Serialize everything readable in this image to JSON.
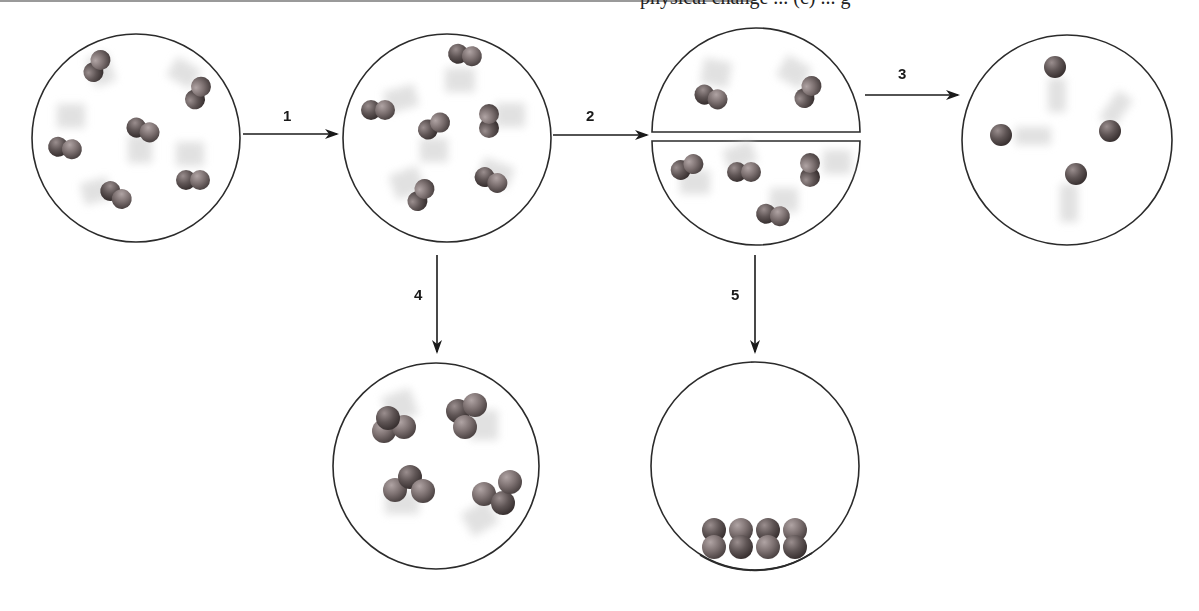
{
  "header": {
    "clipped_text": "physical change ... (c) ... g"
  },
  "diagram": {
    "colors": {
      "outline": "#2b2b2b",
      "molecule_dark": "#5a4f4f",
      "molecule_light": "#8a7e7e",
      "blur": "#d9d9d9",
      "arrow": "#1a1a1a"
    },
    "steps": [
      {
        "id": "1",
        "label": "1",
        "direction": "right",
        "from": "container-A",
        "to": "container-B"
      },
      {
        "id": "2",
        "label": "2",
        "direction": "right",
        "from": "container-B",
        "to": "container-C"
      },
      {
        "id": "3",
        "label": "3",
        "direction": "right",
        "from": "container-C",
        "to": "container-D"
      },
      {
        "id": "4",
        "label": "4",
        "direction": "down",
        "from": "container-B",
        "to": "container-E"
      },
      {
        "id": "5",
        "label": "5",
        "direction": "down",
        "from": "container-C",
        "to": "container-F"
      }
    ],
    "containers": [
      {
        "id": "container-A",
        "name": "Diatomic gas molecules",
        "particle_type": "diatomic",
        "count": 6
      },
      {
        "id": "container-B",
        "name": "Diatomic gas molecules (moved)",
        "particle_type": "diatomic",
        "count": 6
      },
      {
        "id": "container-C",
        "name": "Divided container",
        "particle_type": "diatomic",
        "count_top": 2,
        "count_bottom": 4
      },
      {
        "id": "container-D",
        "name": "Single atoms",
        "particle_type": "monatomic",
        "count": 4
      },
      {
        "id": "container-E",
        "name": "Triatomic molecules",
        "particle_type": "triatomic",
        "count": 4
      },
      {
        "id": "container-F",
        "name": "Condensed at bottom",
        "particle_type": "diatomic",
        "count": 4
      }
    ]
  }
}
